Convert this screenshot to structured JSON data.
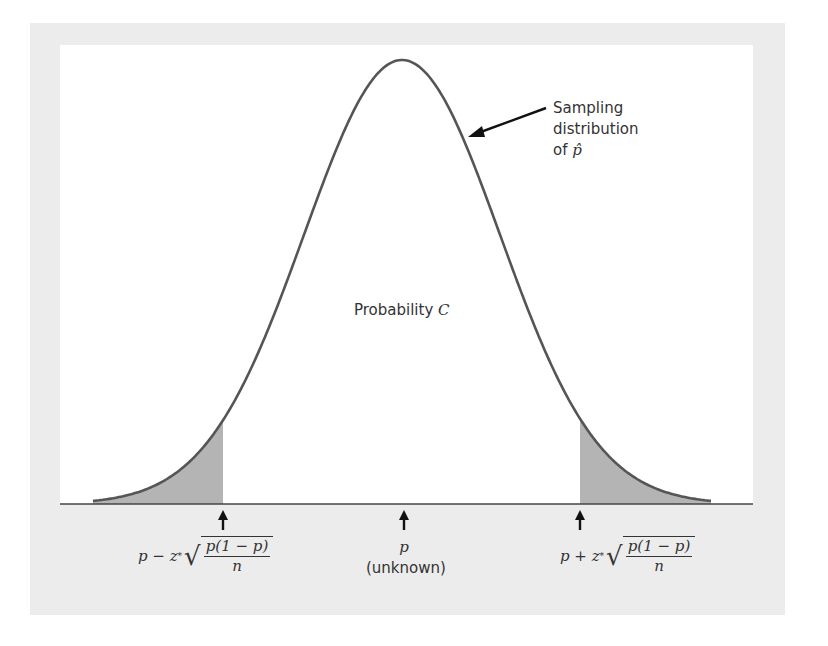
{
  "colors": {
    "frame": "#ececec",
    "panel": "#ffffff",
    "curve": "#555555",
    "shade": "#b4b4b4",
    "axis": "#444444",
    "text": "#333333"
  },
  "curve_label": {
    "line1": "Sampling",
    "line2": "distribution",
    "line3_prefix": "of ",
    "line3_symbol": "p̂"
  },
  "center_label": {
    "text": "Probability ",
    "symbol": "C"
  },
  "markers": [
    {
      "id": "lower",
      "prefix": "p − z",
      "star": "*",
      "num": "p(1 − p)",
      "den": "n"
    },
    {
      "id": "center",
      "symbol": "p",
      "note": "(unknown)"
    },
    {
      "id": "upper",
      "prefix": "p + z",
      "star": "*",
      "num": "p(1 − p)",
      "den": "n"
    }
  ],
  "chart_data": {
    "type": "area",
    "title": "",
    "x_markers": [
      "p − z*√(p(1−p)/n)",
      "p (unknown)",
      "p + z*√(p(1−p)/n)"
    ],
    "annotations": [
      "Sampling distribution of p̂",
      "Probability C"
    ],
    "shaded_regions": [
      "left tail",
      "right tail"
    ],
    "grid": false
  }
}
